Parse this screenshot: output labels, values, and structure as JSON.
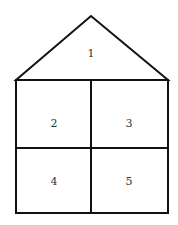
{
  "diagram": {
    "type": "house-shape-regions",
    "regions": [
      {
        "id": "1",
        "label": "1",
        "shape": "triangle-roof"
      },
      {
        "id": "2",
        "label": "2",
        "shape": "square-top-left"
      },
      {
        "id": "3",
        "label": "3",
        "shape": "square-top-right"
      },
      {
        "id": "4",
        "label": "4",
        "shape": "square-bottom-left"
      },
      {
        "id": "5",
        "label": "5",
        "shape": "square-bottom-right"
      }
    ],
    "stroke_color": "#111111"
  }
}
